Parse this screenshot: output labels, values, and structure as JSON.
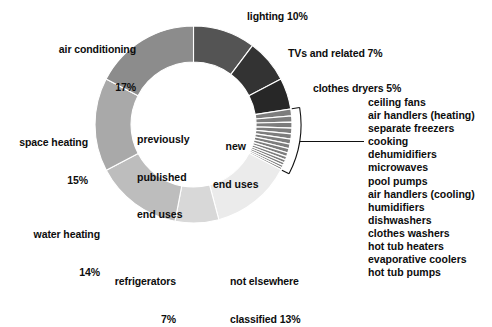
{
  "chart_data": {
    "type": "pie",
    "title": "",
    "subtitle": "",
    "xlabel": "",
    "ylabel": "",
    "legend_position": "callout-labels",
    "grid": false,
    "donut": true,
    "inner_radius_ratio": 0.63,
    "start_angle_deg": 0,
    "direction": "clockwise",
    "groups": [
      {
        "name": "previously published end uses",
        "center_label": "previously\npublished\nend uses",
        "categories": [
          "air conditioning",
          "space heating",
          "water heating",
          "refrigerators",
          "not elsewhere classified",
          "lighting"
        ],
        "note": "left and lower portion of ring, light to mid grays"
      },
      {
        "name": "new end uses",
        "center_label": "new\nend uses",
        "categories": [
          "lighting",
          "TVs and related",
          "clothes dryers",
          "ceiling fans",
          "air handlers (heating)",
          "separate freezers",
          "cooking",
          "dehumidifiers",
          "microwaves",
          "pool pumps",
          "air handlers (cooling)",
          "humidifiers",
          "dishwashers",
          "clothes washers",
          "hot tub heaters",
          "evaporative coolers",
          "hot tub pumps"
        ],
        "note": "right portion of ring, dark grays plus thin wedges"
      }
    ],
    "categories": [
      "lighting",
      "TVs and related",
      "clothes dryers",
      "ceiling fans",
      "air handlers (heating)",
      "separate freezers",
      "cooking",
      "dehumidifiers",
      "microwaves",
      "pool pumps",
      "air handlers (cooling)",
      "humidifiers",
      "dishwashers",
      "clothes washers",
      "hot tub heaters",
      "evaporative coolers",
      "hot tub pumps",
      "not elsewhere classified",
      "refrigerators",
      "water heating",
      "space heating",
      "air conditioning"
    ],
    "values": [
      10,
      7,
      5,
      1.1,
      1.0,
      0.95,
      0.9,
      0.85,
      0.8,
      0.75,
      0.7,
      0.6,
      0.55,
      0.5,
      0.45,
      0.4,
      0.35,
      13,
      7,
      14,
      15,
      17
    ],
    "colors": [
      "#545454",
      "#333333",
      "#272727",
      "#7d7d7d",
      "#7d7d7d",
      "#7d7d7d",
      "#7d7d7d",
      "#7d7d7d",
      "#7d7d7d",
      "#7d7d7d",
      "#7d7d7d",
      "#7d7d7d",
      "#7d7d7d",
      "#7d7d7d",
      "#7d7d7d",
      "#7d7d7d",
      "#7d7d7d",
      "#ebebeb",
      "#d8d8d8",
      "#bdbdbd",
      "#a9a9a9",
      "#8c8c8c"
    ],
    "unit": "percent"
  },
  "center": {
    "left_line1": "previously",
    "left_line2": "published",
    "left_line3": "end uses",
    "right_line1": "new",
    "right_line2": "end uses"
  },
  "callouts": {
    "air_conditioning_line1": "air conditioning",
    "air_conditioning_line2": "17%",
    "space_heating_line1": "space heating",
    "space_heating_line2": "15%",
    "water_heating_line1": "water heating",
    "water_heating_line2": "14%",
    "refrigerators_line1": "refrigerators",
    "refrigerators_line2": "7%",
    "nec_line1": "not elsewhere",
    "nec_line2": "classified 13%",
    "lighting": "lighting 10%",
    "tvs": "TVs and related 7%",
    "clothes_dryers": "clothes dryers 5%"
  },
  "small_uses_list": [
    "ceiling fans",
    "air handlers (heating)",
    "separate freezers",
    "cooking",
    "dehumidifiers",
    "microwaves",
    "pool pumps",
    "air handlers (cooling)",
    "humidifiers",
    "dishwashers",
    "clothes washers",
    "hot tub heaters",
    "evaporative coolers",
    "hot tub pumps"
  ]
}
